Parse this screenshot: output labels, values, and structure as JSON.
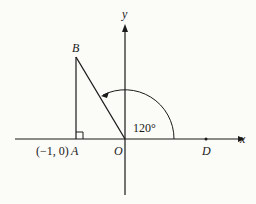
{
  "diagram": {
    "axes": {
      "x_label": "x",
      "y_label": "y"
    },
    "points": {
      "O": {
        "label": "O"
      },
      "A": {
        "label": "A",
        "coord_label": "(−1, 0)"
      },
      "B": {
        "label": "B"
      },
      "D": {
        "label": "D"
      }
    },
    "angle": {
      "label": "120°",
      "from": "OD",
      "to": "OB"
    },
    "right_angle_at": "A",
    "colors": {
      "ink": "#1a1a1a",
      "background": "#fbfbf8"
    }
  }
}
